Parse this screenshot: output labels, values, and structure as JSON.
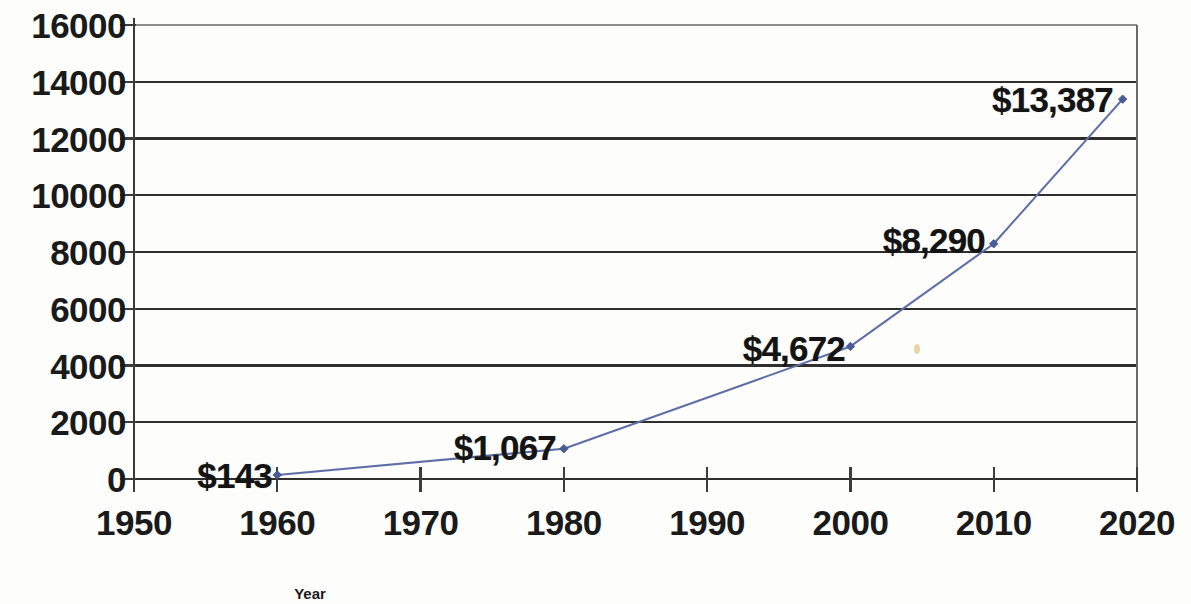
{
  "chart_data": {
    "type": "line",
    "title": "",
    "xlabel": "Year",
    "ylabel": "",
    "xlim": [
      1950,
      2020
    ],
    "ylim": [
      0,
      16000
    ],
    "grid": true,
    "legend": false,
    "marker": "diamond",
    "line_color": "#5f6fa6",
    "axis_color": "#3c3c3c",
    "gridline_color": "#2f2f2f",
    "x": [
      1960,
      1980,
      2000,
      2010,
      2019
    ],
    "values": [
      143,
      1067,
      4672,
      8290,
      13387
    ],
    "categories": [
      "1960",
      "1980",
      "2000",
      "2010",
      "2019"
    ],
    "point_labels": [
      "$143",
      "$1,067",
      "$4,672",
      "$8,290",
      "$13,387"
    ],
    "y_ticks": [
      "16000",
      "14000",
      "12000",
      "10000",
      "8000",
      "6000",
      "4000",
      "2000",
      "0"
    ],
    "y_tick_values": [
      16000,
      14000,
      12000,
      10000,
      8000,
      6000,
      4000,
      2000,
      0
    ],
    "x_ticks": [
      "1950",
      "1960",
      "1970",
      "1980",
      "1990",
      "2000",
      "2010",
      "2020"
    ],
    "x_tick_values": [
      1950,
      1960,
      1970,
      1980,
      1990,
      2000,
      2010,
      2020
    ],
    "label_anchors": [
      {
        "text": "$143",
        "x": 272,
        "y": 475
      },
      {
        "text": "$1,067",
        "x": 556,
        "y": 447
      },
      {
        "text": "$4,672",
        "x": 845,
        "y": 348
      },
      {
        "text": "$8,290",
        "x": 985,
        "y": 240
      },
      {
        "text": "$13,387",
        "x": 1113,
        "y": 99
      }
    ]
  }
}
